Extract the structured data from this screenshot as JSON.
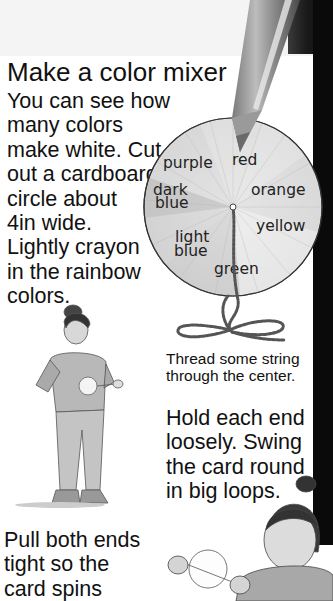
{
  "page": {
    "title": "Make a color mixer",
    "intro_lines": [
      "You can see how",
      "many colors",
      "make white. Cut",
      "out a cardboard",
      "circle about",
      "4in wide.",
      "Lightly crayon",
      "in the rainbow",
      "colors."
    ],
    "caption_lines": [
      "Thread some string",
      "through the center."
    ],
    "step3_lines": [
      "Hold each end",
      "loosely. Swing",
      "the card round",
      "in big loops."
    ],
    "step4_lines": [
      "Pull both ends",
      "tight so the",
      "card spins"
    ]
  },
  "color_wheel": {
    "labels": {
      "purple": "purple",
      "red": "red",
      "dark_blue_1": "dark",
      "dark_blue_2": "blue",
      "orange": "orange",
      "yellow": "yellow",
      "light_blue_1": "light",
      "light_blue_2": "blue",
      "green": "green"
    }
  },
  "illustrations": {
    "pencil": "colored-pencil",
    "string": "twisted-string-loop",
    "child_standing": "child-holding-spinner",
    "child_swinging": "child-swinging-card"
  },
  "colors": {
    "background": "#ffffff",
    "top_band": "#f4f4f4",
    "dark_bar": "#0a0a0a",
    "text": "#111111"
  }
}
